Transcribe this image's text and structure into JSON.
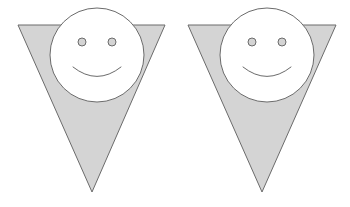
{
  "page": {
    "background_color": "#ffffff",
    "width": 350,
    "height": 207
  },
  "style": {
    "triangle_fill": "#d4d4d4",
    "triangle_stroke": "#6b6b6b",
    "triangle_stroke_width": 1,
    "face_fill": "#ffffff",
    "face_stroke": "#6b6b6b",
    "face_stroke_width": 1,
    "eye_fill": "#d4d4d4",
    "eye_stroke": "#6b6b6b",
    "eye_stroke_width": 1,
    "smile_stroke": "#6b6b6b",
    "smile_stroke_width": 1
  },
  "figures": [
    {
      "id": "figure-left",
      "label": "Left figure",
      "triangle": {
        "label": "Inverted triangle",
        "points": "18,25 165,25 92,192",
        "top_left_x": 18,
        "top_right_x": 165,
        "top_y": 25,
        "apex_x": 92,
        "apex_y": 192
      },
      "face": {
        "label": "Smiley face circle",
        "cx": 97,
        "cy": 55,
        "r": 47
      },
      "eyes": [
        {
          "label": "Left eye",
          "cx": 82,
          "cy": 42,
          "r": 4
        },
        {
          "label": "Right eye",
          "cx": 112,
          "cy": 42,
          "r": 4
        }
      ],
      "smile": {
        "label": "Smile arc",
        "path": "M 73 67 Q 97 86 121 67"
      }
    },
    {
      "id": "figure-right",
      "label": "Right figure",
      "triangle": {
        "label": "Inverted triangle",
        "points": "188,25 336,25 262,192",
        "top_left_x": 188,
        "top_right_x": 336,
        "top_y": 25,
        "apex_x": 262,
        "apex_y": 192
      },
      "face": {
        "label": "Smiley face circle",
        "cx": 267,
        "cy": 55,
        "r": 47
      },
      "eyes": [
        {
          "label": "Left eye",
          "cx": 252,
          "cy": 42,
          "r": 4
        },
        {
          "label": "Right eye",
          "cx": 282,
          "cy": 42,
          "r": 4
        }
      ],
      "smile": {
        "label": "Smile arc",
        "path": "M 243 67 Q 267 86 291 67"
      }
    }
  ]
}
